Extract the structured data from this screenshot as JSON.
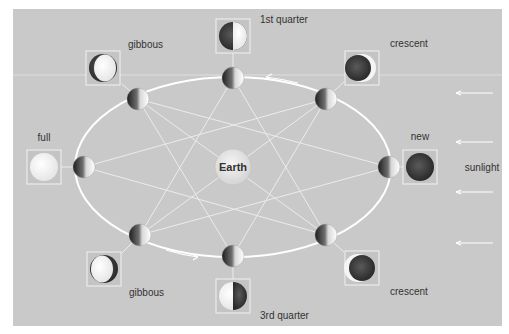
{
  "diagram": {
    "center_label": "Earth",
    "sunlight_label": "sunlight",
    "colors": {
      "panel": "#c9c9c9",
      "orbit": "#ffffff",
      "moon_dark": "#3a3a3a",
      "moon_light": "#f7f7f7",
      "box_border": "#f2f2f2"
    },
    "phases": [
      {
        "id": "first-quarter",
        "label": "1st quarter"
      },
      {
        "id": "crescent-waxing",
        "label": "crescent"
      },
      {
        "id": "new",
        "label": "new"
      },
      {
        "id": "crescent-waning",
        "label": "crescent"
      },
      {
        "id": "third-quarter",
        "label": "3rd quarter"
      },
      {
        "id": "gibbous-bottom",
        "label": "gibbous"
      },
      {
        "id": "full",
        "label": "full"
      },
      {
        "id": "gibbous-top",
        "label": "gibbous"
      }
    ]
  }
}
